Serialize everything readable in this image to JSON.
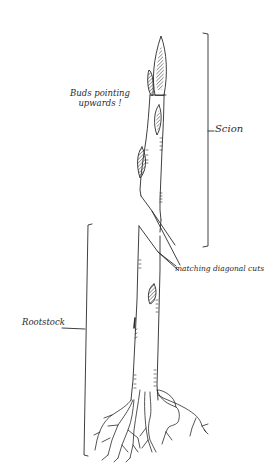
{
  "diagram": {
    "type": "hand-drawn botanical illustration",
    "colors": {
      "ink": "#2a2a2a",
      "background": "#ffffff"
    },
    "labels": {
      "buds_line1": "Buds pointing",
      "buds_line2": "upwards !",
      "scion": "Scion",
      "cuts": "matching diagonal cuts",
      "rootstock": "Rootstock"
    },
    "parts": [
      {
        "name": "Scion",
        "description": "upper grafted section with buds pointing upwards"
      },
      {
        "name": "Graft union",
        "description": "matching diagonal cuts joining scion to rootstock"
      },
      {
        "name": "Rootstock",
        "description": "lower section with root system"
      }
    ]
  }
}
